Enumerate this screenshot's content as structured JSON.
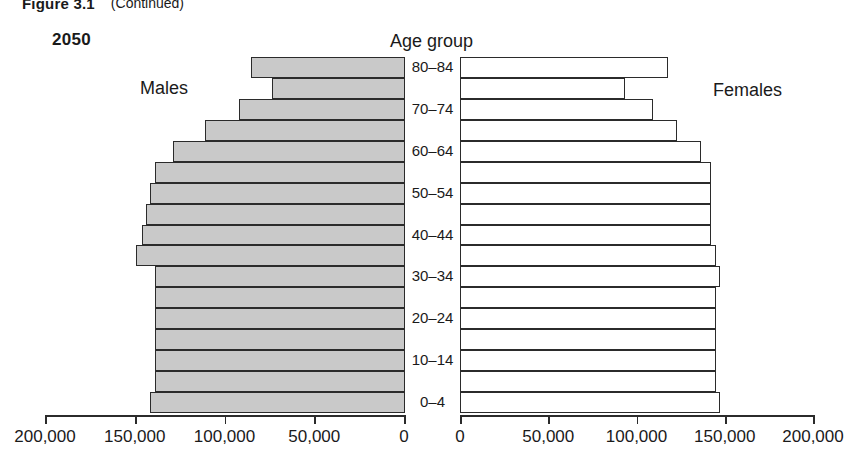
{
  "header": {
    "figure_number": "Figure 3.1",
    "continued": "(Continued)"
  },
  "labels": {
    "year": "2050",
    "age_group_title": "Age group",
    "males": "Males",
    "females": "Females"
  },
  "chart_data": {
    "type": "bar",
    "subtype": "population-pyramid",
    "title": "2050",
    "xlabel": "",
    "ylabel": "Age group",
    "grid": false,
    "legend_position": "inline-sides",
    "axis_left": {
      "label_side": "Males",
      "ticks": [
        "200,000",
        "150,000",
        "100,000",
        "50,000",
        "0"
      ],
      "tick_values": [
        200000,
        150000,
        100000,
        50000,
        0
      ],
      "range": [
        200000,
        0
      ],
      "direction": "reversed"
    },
    "axis_right": {
      "label_side": "Females",
      "ticks": [
        "0",
        "50,000",
        "100,000",
        "150,000",
        "200,000"
      ],
      "tick_values": [
        0,
        50000,
        100000,
        150000,
        200000
      ],
      "range": [
        0,
        200000
      ],
      "direction": "normal"
    },
    "categories": [
      "80-84",
      "75-79",
      "70-74",
      "65-69",
      "60-64",
      "55-59",
      "50-54",
      "45-49",
      "40-44",
      "35-39",
      "30-34",
      "25-29",
      "20-24",
      "15-19",
      "10-14",
      "5-9",
      "0-4"
    ],
    "category_tick_labels": [
      "80–84",
      "",
      "70–74",
      "",
      "60–64",
      "",
      "50–54",
      "",
      "40–44",
      "",
      "30–34",
      "",
      "20–24",
      "",
      "10–14",
      "",
      "0–4"
    ],
    "series": [
      {
        "name": "Males",
        "values": [
          81000,
          70000,
          87000,
          105000,
          122000,
          131000,
          134000,
          136000,
          138000,
          141000,
          131000,
          131000,
          131000,
          131000,
          131000,
          131000,
          134000
        ]
      },
      {
        "name": "Females",
        "values": [
          111000,
          88000,
          103000,
          116000,
          129000,
          134000,
          134000,
          134000,
          134000,
          137000,
          139000,
          137000,
          137000,
          137000,
          137000,
          137000,
          139000
        ]
      }
    ]
  }
}
